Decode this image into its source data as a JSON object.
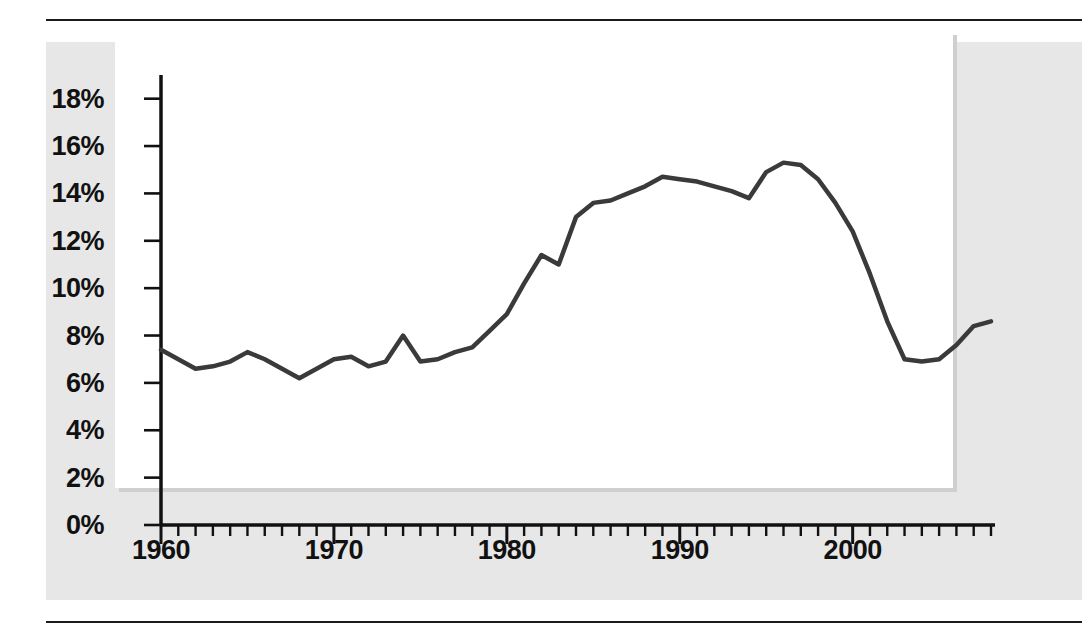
{
  "figure": {
    "panel_bg": "#e7e7e7",
    "plot_bg": "#ffffff",
    "line_color": "#3a3a3a",
    "axis_color": "#111111"
  },
  "chart_data": {
    "type": "line",
    "title": "",
    "subtitle": "",
    "xlabel": "",
    "ylabel": "",
    "xlim": [
      1960,
      2008
    ],
    "ylim": [
      0,
      19
    ],
    "grid": false,
    "legend": false,
    "y_tick_labels": [
      "0%",
      "2%",
      "4%",
      "6%",
      "8%",
      "10%",
      "12%",
      "14%",
      "16%",
      "18%"
    ],
    "y_ticks": [
      0,
      2,
      4,
      6,
      8,
      10,
      12,
      14,
      16,
      18
    ],
    "x_tick_labels": [
      "1960",
      "1970",
      "1980",
      "1990",
      "2000"
    ],
    "x_major_ticks": [
      1960,
      1970,
      1980,
      1990,
      2000
    ],
    "x_minor_tick_interval": 1,
    "series": [
      {
        "name": "value",
        "x": [
          1960,
          1961,
          1962,
          1963,
          1964,
          1965,
          1966,
          1967,
          1968,
          1969,
          1970,
          1971,
          1972,
          1973,
          1974,
          1975,
          1976,
          1977,
          1978,
          1979,
          1980,
          1981,
          1982,
          1983,
          1984,
          1985,
          1986,
          1987,
          1988,
          1989,
          1990,
          1991,
          1992,
          1993,
          1994,
          1995,
          1996,
          1997,
          1998,
          1999,
          2000,
          2001,
          2002,
          2003,
          2004,
          2005,
          2006,
          2007,
          2008
        ],
        "values": [
          7.4,
          7.0,
          6.6,
          6.7,
          6.9,
          7.3,
          7.0,
          6.6,
          6.2,
          6.6,
          7.0,
          7.1,
          6.7,
          6.9,
          8.0,
          6.9,
          7.0,
          7.3,
          7.5,
          8.2,
          8.9,
          10.2,
          11.4,
          11.0,
          13.0,
          13.6,
          13.7,
          14.0,
          14.3,
          14.7,
          14.6,
          14.5,
          14.3,
          14.1,
          13.8,
          14.9,
          15.3,
          15.2,
          14.6,
          13.6,
          12.4,
          10.6,
          8.6,
          7.0,
          6.9,
          7.0,
          7.6,
          8.4,
          8.6
        ]
      }
    ]
  }
}
